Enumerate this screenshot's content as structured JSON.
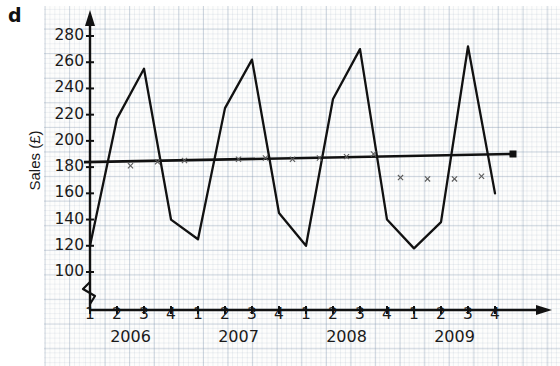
{
  "question_letter": "d",
  "axes": {
    "y_title": "Sales (£)",
    "y_ticks": [
      100,
      120,
      140,
      160,
      180,
      200,
      220,
      240,
      260,
      280
    ],
    "y_min": 92,
    "y_max": 292,
    "y_break": true,
    "x_quarters": [
      "1",
      "2",
      "3",
      "4",
      "1",
      "2",
      "3",
      "4",
      "1",
      "2",
      "3",
      "4",
      "1",
      "2",
      "3",
      "4"
    ],
    "years": [
      "2006",
      "2007",
      "2008",
      "2009"
    ]
  },
  "colors": {
    "ink": "#111111",
    "grid_major": "#8296af",
    "grid_minor": "#96a8be",
    "paper": "#fdfdfc"
  },
  "chart_data": {
    "type": "line",
    "title": "",
    "xlabel": "",
    "ylabel": "Sales (£)",
    "ylim": [
      92,
      292
    ],
    "grid": true,
    "legend": "none",
    "categories": [
      "2006 Q1",
      "2006 Q2",
      "2006 Q3",
      "2006 Q4",
      "2007 Q1",
      "2007 Q2",
      "2007 Q3",
      "2007 Q4",
      "2008 Q1",
      "2008 Q2",
      "2008 Q3",
      "2008 Q4",
      "2009 Q1",
      "2009 Q2",
      "2009 Q3",
      "2009 Q4"
    ],
    "series": [
      {
        "name": "Sales",
        "type": "line",
        "values": [
          120,
          217,
          255,
          140,
          125,
          225,
          262,
          145,
          120,
          232,
          270,
          140,
          118,
          138,
          272,
          160
        ]
      },
      {
        "name": "Trend line",
        "type": "line",
        "endpoints": [
          {
            "x": "2006 Q1",
            "y": 184
          },
          {
            "x": "2009 Q4",
            "y": 190
          }
        ],
        "marker_end": "square"
      },
      {
        "name": "Moving average",
        "type": "scatter",
        "marker": "x",
        "points": [
          {
            "x": "2006 Q2",
            "y": 181
          },
          {
            "x": "2006 Q3",
            "y": 184
          },
          {
            "x": "2006 Q4",
            "y": 185
          },
          {
            "x": "2007 Q2",
            "y": 186
          },
          {
            "x": "2007 Q3",
            "y": 187
          },
          {
            "x": "2007 Q4",
            "y": 186
          },
          {
            "x": "2008 Q1",
            "y": 187
          },
          {
            "x": "2008 Q2",
            "y": 188
          },
          {
            "x": "2008 Q3",
            "y": 190
          },
          {
            "x": "2008 Q4",
            "y": 172
          },
          {
            "x": "2009 Q1",
            "y": 171
          },
          {
            "x": "2009 Q2",
            "y": 171
          },
          {
            "x": "2009 Q3",
            "y": 173
          }
        ]
      }
    ]
  }
}
